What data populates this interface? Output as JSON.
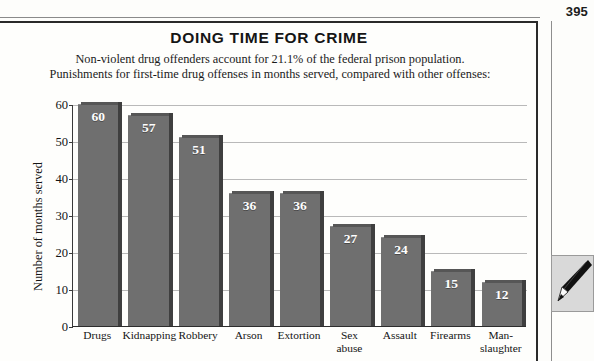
{
  "page": {
    "page_number": "395"
  },
  "figure": {
    "title": "DOING TIME FOR CRIME",
    "subtitle_line1": "Non-violent drug offenders account for 21.1% of the federal prison population.",
    "subtitle_line2": "Punishments for first-time drug offenses in months served, compared with other offenses:",
    "pencil_icon": "pencil-icon"
  },
  "chart_data": {
    "type": "bar",
    "title": "DOING TIME FOR CRIME",
    "subtitle": "Non-violent drug offenders account for 21.1% of the federal prison population. Punishments for first-time drug offenses in months served, compared with other offenses:",
    "xlabel": "",
    "ylabel": "Number of months served",
    "ylim": [
      0,
      60
    ],
    "yticks": [
      0,
      10,
      20,
      30,
      40,
      50,
      60
    ],
    "ytick_labels": [
      "0",
      "10",
      "20",
      "30",
      "40",
      "50",
      "60"
    ],
    "grid": true,
    "grid_axis": "y",
    "legend": false,
    "bar_color": "#6f6f6f",
    "bar_side_color": "#3f3f3f",
    "value_label_color": "#ffffff",
    "categories": [
      "Drugs",
      "Kidnapping",
      "Robbery",
      "Arson",
      "Extortion",
      "Sex abuse",
      "Assault",
      "Firearms",
      "Man-slaughter"
    ],
    "category_lines": [
      [
        "Drugs"
      ],
      [
        "Kidnapping"
      ],
      [
        "Robbery"
      ],
      [
        "Arson"
      ],
      [
        "Extortion"
      ],
      [
        "Sex",
        "abuse"
      ],
      [
        "Assault"
      ],
      [
        "Firearms"
      ],
      [
        "Man-",
        "slaughter"
      ]
    ],
    "values": [
      60,
      57,
      51,
      36,
      36,
      27,
      24,
      15,
      12
    ],
    "value_labels": [
      "60",
      "57",
      "51",
      "36",
      "36",
      "27",
      "24",
      "15",
      "12"
    ]
  }
}
